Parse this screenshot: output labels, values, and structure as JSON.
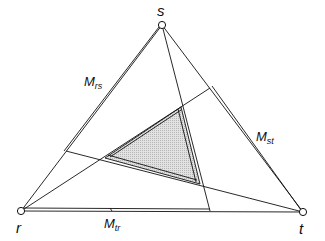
{
  "diagram": {
    "type": "triangle-construction",
    "stroke_color": "#111111",
    "fill_color": "#d6d6d6",
    "vertices": [
      {
        "id": "s",
        "label": "s",
        "x": 162,
        "y": 25
      },
      {
        "id": "r",
        "label": "r",
        "x": 21,
        "y": 211
      },
      {
        "id": "t",
        "label": "t",
        "x": 303,
        "y": 212
      }
    ],
    "edge_labels": [
      {
        "id": "Mrs",
        "main": "M",
        "sub": "rs",
        "x": 83,
        "y": 72
      },
      {
        "id": "Mst",
        "main": "M",
        "sub": "st",
        "x": 255,
        "y": 128
      },
      {
        "id": "Mtr",
        "main": "M",
        "sub": "tr",
        "x": 104,
        "y": 218
      }
    ],
    "cevians": [
      {
        "from": "s",
        "to_x": 210,
        "to_y": 211
      },
      {
        "from": "r",
        "to_x": 210,
        "to_y": 88
      },
      {
        "from": "t",
        "to_x": 66,
        "to_y": 151
      }
    ],
    "inner_triangle": [
      {
        "x": 181,
        "y": 107
      },
      {
        "x": 105,
        "y": 158
      },
      {
        "x": 200,
        "y": 184
      }
    ]
  }
}
